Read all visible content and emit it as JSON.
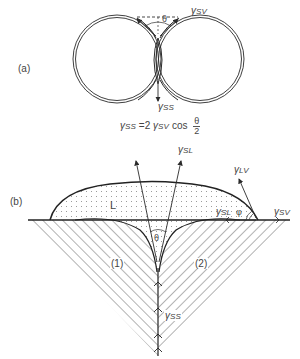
{
  "panel_a": {
    "label": "(a)",
    "gamma_sv": {
      "symbol": "γ",
      "sub": "SV"
    },
    "gamma_ss": {
      "symbol": "γ",
      "sub": "SS"
    },
    "theta": "θ",
    "formula": {
      "lhs_symbol": "γ",
      "lhs_sub": "SS",
      "equals": "=2",
      "rhs_symbol": "γ",
      "rhs_sub": "SV",
      "func": "cos",
      "frac_num": "θ",
      "frac_den": "2"
    }
  },
  "panel_b": {
    "label": "(b)",
    "liquid_label": "L",
    "gamma_sl_top": {
      "symbol": "γ",
      "sub": "SL"
    },
    "gamma_lv": {
      "symbol": "γ",
      "sub": "LV"
    },
    "gamma_sl_edge": {
      "symbol": "γ",
      "sub": "SL"
    },
    "gamma_sv": {
      "symbol": "γ",
      "sub": "SV"
    },
    "gamma_ss": {
      "symbol": "γ",
      "sub": "SS"
    },
    "phi": "φ",
    "theta": "θ",
    "grain_1": "(1)",
    "grain_2": "(2)"
  },
  "colors": {
    "line": "#2a2a2a",
    "hatch": "#555555",
    "dots": "#888888",
    "text": "#444444"
  }
}
